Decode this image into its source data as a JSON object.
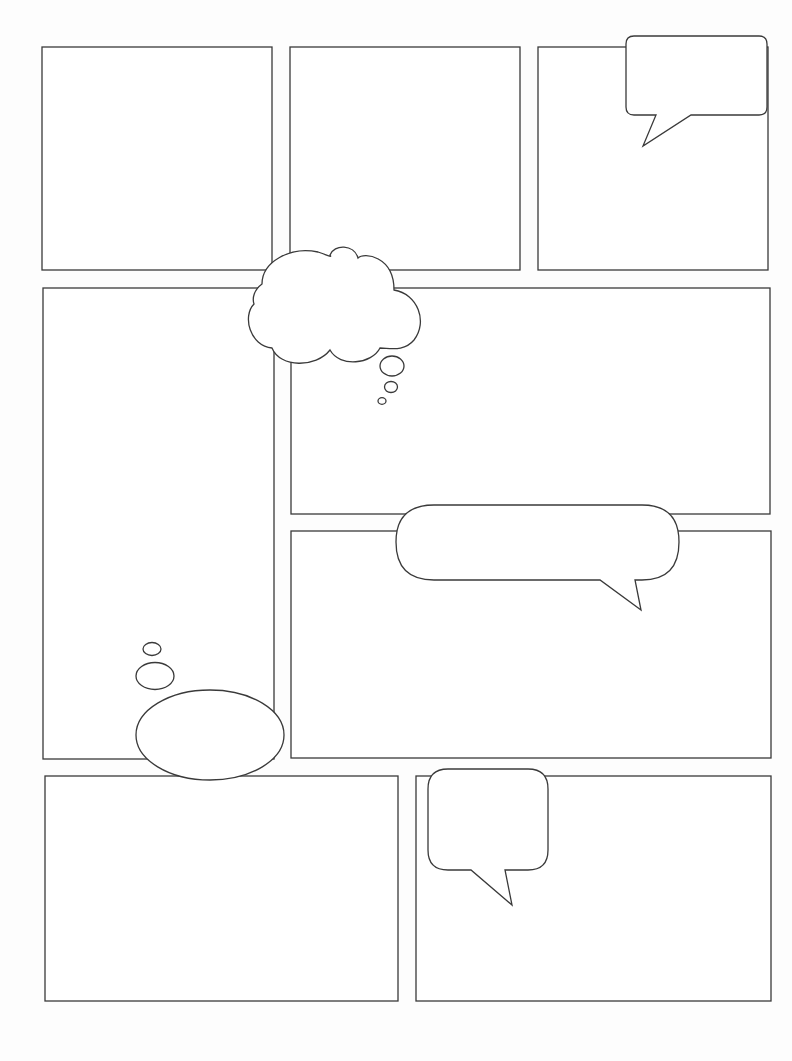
{
  "page": {
    "type": "blank comic page template",
    "background": "#fdfdfd",
    "line_color": "#3a3a3a"
  },
  "panels": [
    {
      "id": "panel-1",
      "x": 42,
      "y": 47,
      "w": 230,
      "h": 223
    },
    {
      "id": "panel-2",
      "x": 290,
      "y": 47,
      "w": 230,
      "h": 223
    },
    {
      "id": "panel-3",
      "x": 538,
      "y": 47,
      "w": 230,
      "h": 223
    },
    {
      "id": "panel-4",
      "x": 43,
      "y": 288,
      "w": 231,
      "h": 471
    },
    {
      "id": "panel-5",
      "x": 291,
      "y": 288,
      "w": 479,
      "h": 226
    },
    {
      "id": "panel-6",
      "x": 291,
      "y": 531,
      "w": 480,
      "h": 227
    },
    {
      "id": "panel-7",
      "x": 45,
      "y": 776,
      "w": 353,
      "h": 225
    },
    {
      "id": "panel-8",
      "x": 416,
      "y": 776,
      "w": 355,
      "h": 225
    }
  ],
  "bubbles": [
    {
      "id": "speech-bubble-top-right",
      "kind": "speech",
      "text": ""
    },
    {
      "id": "thought-cloud-top",
      "kind": "thought",
      "text": ""
    },
    {
      "id": "speech-pill-middle",
      "kind": "speech",
      "text": ""
    },
    {
      "id": "thought-ellipse-left",
      "kind": "thought",
      "text": ""
    },
    {
      "id": "speech-bubble-bottom",
      "kind": "speech",
      "text": ""
    }
  ]
}
